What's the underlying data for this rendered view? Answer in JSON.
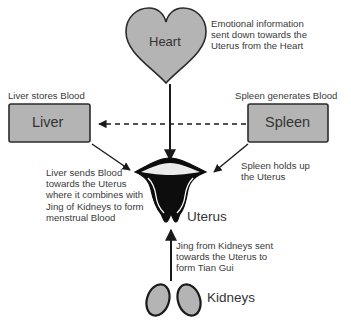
{
  "diagram": {
    "nodes": {
      "heart": {
        "label": "Heart"
      },
      "liver": {
        "label": "Liver"
      },
      "spleen": {
        "label": "Spleen"
      },
      "uterus": {
        "label": "Uterus"
      },
      "kidneys": {
        "label": "Kidneys"
      }
    },
    "annotations": {
      "heart_note": "Emotional information\nsent down towards the\nUterus from the Heart",
      "liver_title": "Liver stores Blood",
      "spleen_title": "Spleen generates Blood",
      "liver_note": "Liver sends Blood\ntowards the Uterus\nwhere it combines with\nJing of Kidneys to form\nmenstrual Blood",
      "spleen_note": "Spleen holds up\nthe Uterus",
      "kidney_note": "Jing from Kidneys sent\ntowards the Uterus to\nform Tian Gui"
    },
    "edges": [
      {
        "from": "heart",
        "to": "uterus",
        "style": "solid"
      },
      {
        "from": "spleen",
        "to": "liver",
        "style": "dashed"
      },
      {
        "from": "liver",
        "to": "uterus",
        "style": "solid"
      },
      {
        "from": "spleen",
        "to": "uterus",
        "style": "solid"
      },
      {
        "from": "kidneys",
        "to": "uterus",
        "style": "solid"
      }
    ],
    "colors": {
      "shape_fill": "#b4b4b4",
      "stroke": "#2b2b2b",
      "uterus_fill": "#0d0d0d"
    }
  }
}
